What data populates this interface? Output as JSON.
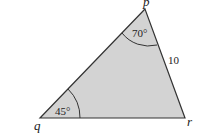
{
  "diagram": {
    "type": "triangle",
    "fill_color": "#d3d3d3",
    "stroke_color": "#333333",
    "vertices": {
      "p": {
        "label": "p"
      },
      "q": {
        "label": "q"
      },
      "r": {
        "label": "r"
      }
    },
    "angles": {
      "p": "70°",
      "q": "45°"
    },
    "sides": {
      "pr": "10"
    }
  }
}
